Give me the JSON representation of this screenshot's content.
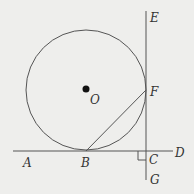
{
  "diagram": {
    "colors": {
      "background": "#eeeeec",
      "stroke": "#555555",
      "text": "#333333"
    },
    "circle": {
      "center_label": "O",
      "cx": 86,
      "cy": 90,
      "r": 60
    },
    "points": {
      "A": {
        "label": "A",
        "x": 28,
        "y": 167
      },
      "B": {
        "label": "B",
        "x": 86,
        "y": 151
      },
      "C": {
        "label": "C",
        "x": 146,
        "y": 151
      },
      "D": {
        "label": "D",
        "x": 177,
        "y": 157
      },
      "E": {
        "label": "E",
        "x": 151,
        "y": 20
      },
      "F": {
        "label": "F",
        "x": 146,
        "y": 90
      },
      "G": {
        "label": "G",
        "x": 151,
        "y": 183
      },
      "O": {
        "label": "O",
        "x": 86,
        "y": 90
      }
    },
    "segments": [
      {
        "name": "line-AD",
        "from": "A",
        "to": "D"
      },
      {
        "name": "line-EG",
        "from": "E",
        "to": "G"
      },
      {
        "name": "segment-BF",
        "from": "B",
        "to": "F"
      }
    ],
    "right_angle_at": "C"
  }
}
